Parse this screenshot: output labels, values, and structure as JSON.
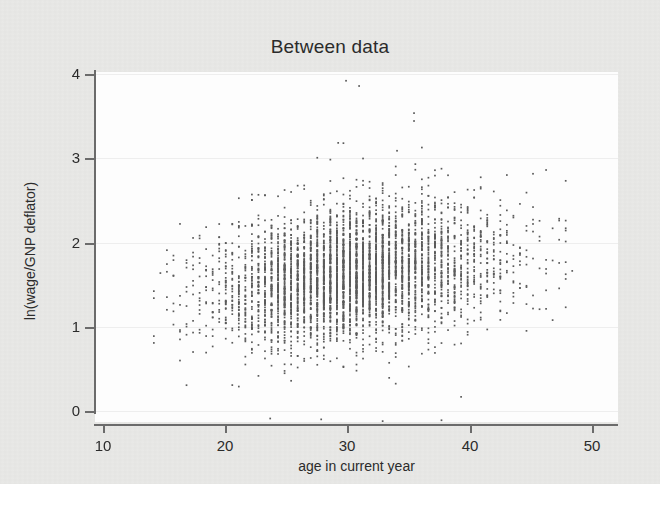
{
  "figure": {
    "background_color": "#e9e9e7",
    "canvas_color": "#fdfdfd",
    "axis_color": "#6b6b6b",
    "gridline_color": "#eeeeee",
    "marker_color": "#5a5a5a"
  },
  "chart_data": {
    "type": "scatter",
    "title": "Between data",
    "xlabel": "age in current year",
    "ylabel": "ln(wage/GNP deflator)",
    "xlim": [
      10,
      50
    ],
    "ylim": [
      0,
      4
    ],
    "xticks": [
      10,
      20,
      30,
      40,
      50
    ],
    "yticks": [
      0,
      1,
      2,
      3,
      4
    ],
    "xtick_labels": [
      "10",
      "20",
      "30",
      "40",
      "50"
    ],
    "ytick_labels": [
      "0",
      "1",
      "2",
      "3",
      "4"
    ],
    "grid": true,
    "grid_axis": "y",
    "legend": false,
    "marker": "small-square-dot",
    "marker_size_px": 1.7,
    "marker_color": "#5a5a5a",
    "n_points": 4697,
    "distribution": {
      "x_range_observed": [
        14.0,
        46.5
      ],
      "y_range_observed": [
        0.0,
        3.92
      ],
      "x_mode": 29.5,
      "y_mode": 1.7,
      "x_sd": 5.1,
      "y_sd": 0.38,
      "correlation": 0.26,
      "age_quantization": 0.5
    },
    "outliers": [
      {
        "x": 29.2,
        "y": 3.9,
        "label": ""
      },
      {
        "x": 30.2,
        "y": 3.84,
        "label": ""
      },
      {
        "x": 34.4,
        "y": 3.53,
        "label": ""
      },
      {
        "x": 34.4,
        "y": 3.44,
        "label": ""
      },
      {
        "x": 28.6,
        "y": 3.19,
        "label": ""
      },
      {
        "x": 33.1,
        "y": 3.1,
        "label": ""
      },
      {
        "x": 27.0,
        "y": 3.02,
        "label": ""
      },
      {
        "x": 33.0,
        "y": 2.92,
        "label": ""
      },
      {
        "x": 23.4,
        "y": 0.04,
        "label": ""
      },
      {
        "x": 27.3,
        "y": 0.03,
        "label": ""
      },
      {
        "x": 32.0,
        "y": 0.01,
        "label": ""
      },
      {
        "x": 36.5,
        "y": 0.02,
        "label": ""
      }
    ]
  }
}
